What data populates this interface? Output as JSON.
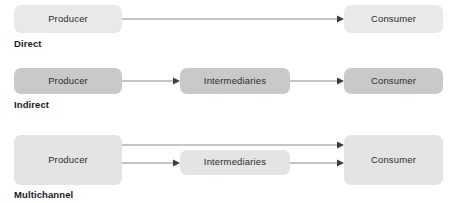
{
  "diagram": {
    "type": "marketing-distribution-channels",
    "background_color": "#ffffff",
    "arrow_line_color": "#8c8c8c",
    "arrow_head_color": "#3d3d3d",
    "rows": [
      {
        "id": "direct",
        "label": "Direct",
        "node_fill": "#e9e9e9",
        "nodes": [
          {
            "id": "producer",
            "label": "Producer"
          },
          {
            "id": "consumer",
            "label": "Consumer"
          }
        ],
        "connections": [
          {
            "from": "producer",
            "to": "consumer"
          }
        ]
      },
      {
        "id": "indirect",
        "label": "Indirect",
        "node_fill": "#c9c9c9",
        "nodes": [
          {
            "id": "producer",
            "label": "Producer"
          },
          {
            "id": "intermediaries",
            "label": "Intermediaries"
          },
          {
            "id": "consumer",
            "label": "Consumer"
          }
        ],
        "connections": [
          {
            "from": "producer",
            "to": "intermediaries"
          },
          {
            "from": "intermediaries",
            "to": "consumer"
          }
        ]
      },
      {
        "id": "multichannel",
        "label": "Multichannel",
        "node_fill": "#e4e4e4",
        "nodes": [
          {
            "id": "producer",
            "label": "Producer"
          },
          {
            "id": "intermediaries",
            "label": "Intermediaries"
          },
          {
            "id": "consumer",
            "label": "Consumer"
          }
        ],
        "connections": [
          {
            "from": "producer",
            "to": "consumer"
          },
          {
            "from": "producer",
            "to": "intermediaries"
          },
          {
            "from": "intermediaries",
            "to": "consumer"
          }
        ]
      }
    ]
  }
}
